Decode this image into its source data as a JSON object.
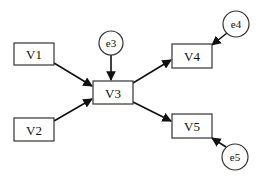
{
  "diagram": {
    "type": "path-diagram",
    "nodes": {
      "V1": {
        "label": "V1",
        "shape": "rect"
      },
      "V2": {
        "label": "V2",
        "shape": "rect"
      },
      "V3": {
        "label": "V3",
        "shape": "rect"
      },
      "V4": {
        "label": "V4",
        "shape": "rect"
      },
      "V5": {
        "label": "V5",
        "shape": "rect"
      },
      "e3": {
        "label": "e3",
        "shape": "circle"
      },
      "e4": {
        "label": "e4",
        "shape": "circle"
      },
      "e5": {
        "label": "e5",
        "shape": "circle"
      }
    },
    "edges": [
      {
        "from": "V1",
        "to": "V3"
      },
      {
        "from": "V2",
        "to": "V3"
      },
      {
        "from": "e3",
        "to": "V3"
      },
      {
        "from": "V3",
        "to": "V4"
      },
      {
        "from": "V3",
        "to": "V5"
      },
      {
        "from": "e4",
        "to": "V4"
      },
      {
        "from": "e5",
        "to": "V5"
      }
    ]
  }
}
